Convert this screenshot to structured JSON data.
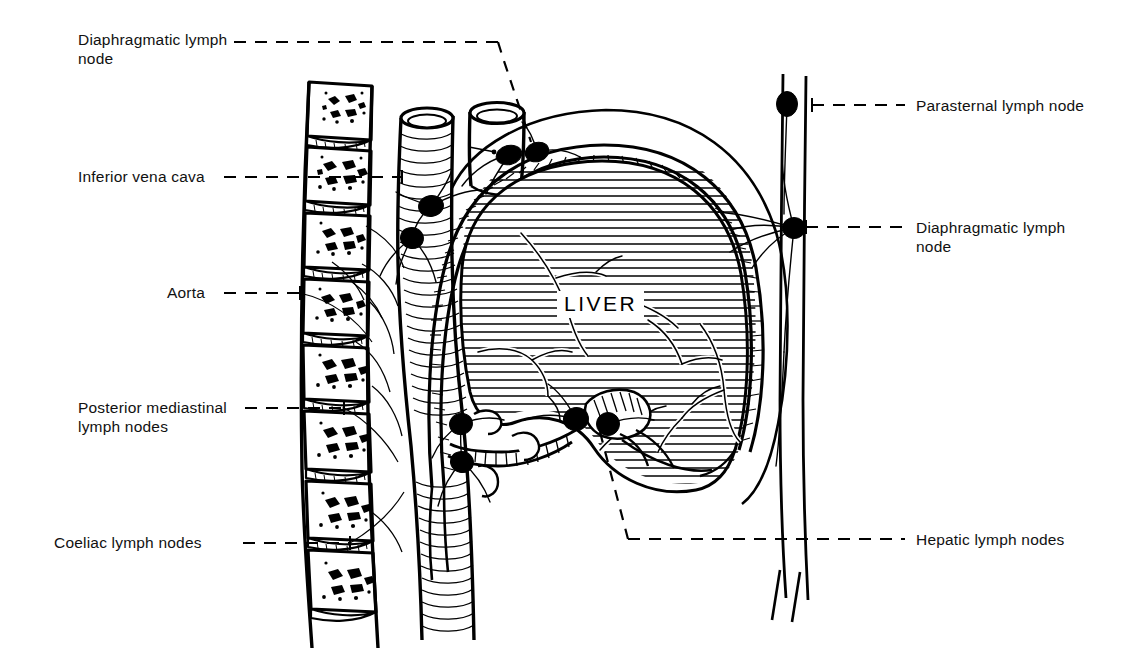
{
  "figure": {
    "background_color": "#ffffff",
    "ink_color": "#000000",
    "width": 1130,
    "height": 662
  },
  "organ_labels": [
    {
      "id": "liver",
      "text": "LIVER",
      "x": 600,
      "y": 303
    }
  ],
  "annotations": {
    "left": [
      {
        "id": "diaphragmatic-lymph-node-upper",
        "text": "Diaphragmatic lymph\nnode",
        "label_x": 78,
        "label_y": 30,
        "leader_dash_y": 42,
        "leader_dash_x1": 234,
        "leader_dash_x2": 500,
        "leader_bend": true
      },
      {
        "id": "inferior-vena-cava",
        "text": "Inferior vena cava",
        "label_x": 78,
        "label_y": 167,
        "leader_dash_y": 177,
        "leader_dash_x1": 224,
        "leader_dash_x2": 402,
        "leader_bend": false
      },
      {
        "id": "aorta",
        "text": "Aorta",
        "label_x": 167,
        "label_y": 283,
        "leader_dash_y": 293,
        "leader_dash_x1": 224,
        "leader_dash_x2": 302,
        "leader_bend": false
      },
      {
        "id": "posterior-mediastinal-lymph-nodes",
        "text": "Posterior mediastinal\nlymph nodes",
        "label_x": 78,
        "label_y": 398,
        "leader_dash_y": 408,
        "leader_dash_x1": 245,
        "leader_dash_x2": 345,
        "leader_bend": false
      },
      {
        "id": "coeliac-lymph-nodes",
        "text": "Coeliac lymph nodes",
        "label_x": 54,
        "label_y": 533,
        "leader_dash_y": 543,
        "leader_dash_x1": 243,
        "leader_dash_x2": 348,
        "leader_bend": false
      }
    ],
    "right": [
      {
        "id": "parasternal-lymph-node",
        "text": "Parasternal lymph node",
        "label_x": 916,
        "label_y": 96,
        "leader_dash_y": 105,
        "leader_dash_x1": 812,
        "leader_dash_x2": 905
      },
      {
        "id": "diaphragmatic-lymph-node-right",
        "text": "Diaphragmatic lymph\nnode",
        "label_x": 916,
        "label_y": 218,
        "leader_dash_y": 227,
        "leader_dash_x1": 806,
        "leader_dash_x2": 905
      },
      {
        "id": "hepatic-lymph-nodes",
        "text": "Hepatic lymph nodes",
        "label_x": 916,
        "label_y": 530,
        "leader_dash_y": 539,
        "leader_dash_x1": 628,
        "leader_dash_x2": 905
      }
    ]
  },
  "lymph_nodes": [
    {
      "id": "node-subphrenic-right-of-ivc",
      "cx": 537,
      "cy": 152,
      "rx": 11,
      "ry": 9,
      "rot": -20
    },
    {
      "id": "node-subphrenic-left",
      "cx": 509,
      "cy": 155,
      "rx": 12,
      "ry": 9,
      "rot": -15
    },
    {
      "id": "node-ivc-upper",
      "cx": 431,
      "cy": 206,
      "rx": 12,
      "ry": 10,
      "rot": -10
    },
    {
      "id": "node-aortic-upper",
      "cx": 412,
      "cy": 238,
      "rx": 11,
      "ry": 10,
      "rot": 10
    },
    {
      "id": "node-parasternal",
      "cx": 787,
      "cy": 104,
      "rx": 10,
      "ry": 12,
      "rot": 0
    },
    {
      "id": "node-diaphragmatic-right",
      "cx": 794,
      "cy": 228,
      "rx": 11,
      "ry": 10,
      "rot": 0
    },
    {
      "id": "node-coeliac-upper",
      "cx": 461,
      "cy": 424,
      "rx": 11,
      "ry": 10,
      "rot": -15
    },
    {
      "id": "node-coeliac-lower",
      "cx": 462,
      "cy": 462,
      "rx": 11,
      "ry": 10,
      "rot": 10
    },
    {
      "id": "node-hepatic-porta-left",
      "cx": 576,
      "cy": 419,
      "rx": 12,
      "ry": 11,
      "rot": -10
    },
    {
      "id": "node-hepatic-porta-right",
      "cx": 608,
      "cy": 424,
      "rx": 11,
      "ry": 11,
      "rot": 0
    }
  ],
  "anatomy": {
    "vertebrae": {
      "name": "vertebral-column",
      "count": 8,
      "top": 78,
      "bottom": 648,
      "front_x": 300,
      "back_x": 378
    },
    "liver": {
      "name": "liver-outline"
    },
    "diaphragm": {
      "name": "diaphragm-outline"
    },
    "chest_wall": {
      "name": "anterior-chest-wall"
    },
    "vessels": [
      {
        "name": "inferior-vena-cava-tube"
      },
      {
        "name": "aorta-tube"
      }
    ]
  }
}
